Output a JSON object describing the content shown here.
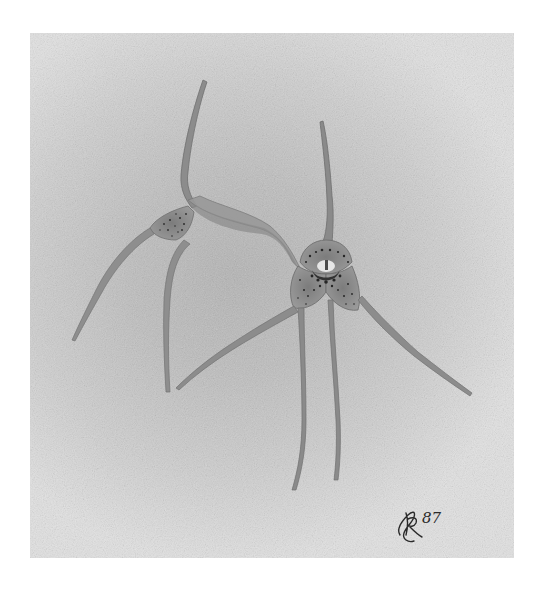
{
  "artwork": {
    "subject": "Two orchid flowers (watercolor botanical illustration)",
    "medium_appearance": "grayscale watercolor on textured paper",
    "colors": {
      "outer_border": "#ffffff",
      "paper_center": "#b4b4b4",
      "paper_edge": "#e2e2e2",
      "petal_wash": "#8a8a8a",
      "petal_outline": "#6e6e6e",
      "speckle": "#2e2e2e",
      "center_highlight": "#e6e6e6"
    },
    "flowers": [
      {
        "name": "left-flower",
        "position": "left, seen from side"
      },
      {
        "name": "right-flower",
        "position": "right, facing viewer, speckled center"
      }
    ],
    "signature": {
      "monogram": "RL",
      "year": "87"
    }
  }
}
